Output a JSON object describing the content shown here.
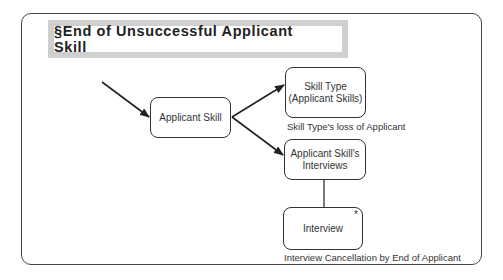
{
  "diagram": {
    "title": "§End of Unsuccessful Applicant Skill",
    "nodes": {
      "applicant_skill": {
        "label": "Applicant Skill"
      },
      "skill_type": {
        "line1": "Skill Type",
        "line2": "(Applicant Skills)",
        "caption": "Skill Type's loss of Applicant"
      },
      "applicant_skill_interviews": {
        "line1": "Applicant Skill's",
        "line2": "Interviews"
      },
      "interview": {
        "label": "Interview",
        "marker": "*",
        "caption": "Interview Cancellation by End of Applicant"
      }
    },
    "edges": [
      {
        "from": "external",
        "to": "applicant_skill",
        "type": "arrow"
      },
      {
        "from": "applicant_skill",
        "to": "skill_type",
        "type": "arrow"
      },
      {
        "from": "applicant_skill",
        "to": "applicant_skill_interviews",
        "type": "arrow"
      },
      {
        "from": "applicant_skill_interviews",
        "to": "interview",
        "type": "line"
      }
    ],
    "colors": {
      "stroke": "#333333",
      "banner_border": "#cfcfcf",
      "background": "#ffffff"
    }
  }
}
